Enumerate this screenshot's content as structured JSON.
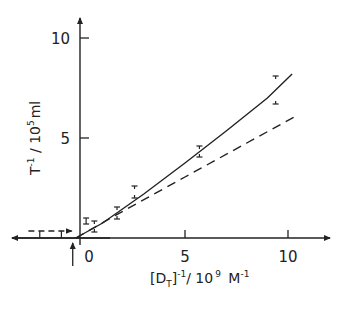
{
  "chart_data": {
    "type": "line",
    "title": "",
    "xlabel": "[D_T]^-1 / 10^9 M^-1",
    "ylabel": "T^-1 / 10^5 ml",
    "xlim": [
      -3.5,
      12
    ],
    "ylim": [
      0,
      11
    ],
    "grid": false,
    "x_ticks": [
      0,
      5,
      10
    ],
    "y_ticks": [
      5,
      10
    ],
    "x_tick_labels": [
      "0",
      "5",
      "10"
    ],
    "y_tick_labels": [
      "5",
      "10"
    ],
    "series": [
      {
        "name": "data points with error bars",
        "style": "error-bar markers",
        "points": [
          {
            "x": 0.2,
            "y": 0.85,
            "err_low": 0.7,
            "err_high": 1.0
          },
          {
            "x": 0.6,
            "y": 0.55,
            "err_low": 0.3,
            "err_high": 0.85
          },
          {
            "x": 1.7,
            "y": 1.3,
            "err_low": 0.95,
            "err_high": 1.55
          },
          {
            "x": 2.55,
            "y": 2.3,
            "err_low": 2.0,
            "err_high": 2.6
          },
          {
            "x": 5.7,
            "y": 4.3,
            "err_low": 4.05,
            "err_high": 4.6
          },
          {
            "x": 9.4,
            "y": 7.4,
            "err_low": 6.7,
            "err_high": 8.1
          }
        ]
      },
      {
        "name": "fitted curve (solid)",
        "style": "solid",
        "x": [
          -0.3,
          1.0,
          3.0,
          5.0,
          7.0,
          9.0,
          10.2
        ],
        "y": [
          0.0,
          0.75,
          2.2,
          3.75,
          5.35,
          7.0,
          8.2
        ]
      },
      {
        "name": "initial slope (dashed)",
        "style": "dashed",
        "x": [
          -0.3,
          2.0,
          5.0,
          8.0,
          10.3
        ],
        "y": [
          0.0,
          1.35,
          3.05,
          4.75,
          6.05
        ]
      },
      {
        "name": "extrapolation to y-intercept (dashed horizontal)",
        "style": "dashed-arrow",
        "x": [
          -2.6,
          -0.5
        ],
        "y": [
          0.35,
          0.35
        ]
      }
    ],
    "annotations": [
      {
        "type": "arrow",
        "label": "x-intercept marker",
        "x": -0.45,
        "direction": "up"
      },
      {
        "type": "tick-marks",
        "label": "left-axis error ticks",
        "x": [
          -2.05,
          -1.0
        ]
      }
    ]
  },
  "labels": {
    "y_axis": {
      "main": "T",
      "sup1": "-1",
      "rest": " / 10",
      "sup2": "5",
      "unit": "ml"
    },
    "x_axis": {
      "open": "[D",
      "sub": "T",
      "close": "]",
      "sup1": "-1",
      "rest": "/ 10",
      "sup2": "9",
      "unit": " M",
      "sup3": "-1"
    }
  }
}
